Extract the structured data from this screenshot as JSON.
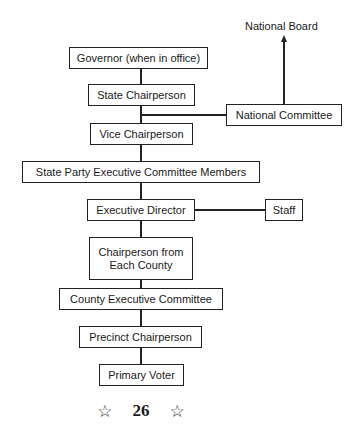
{
  "diagram": {
    "external": {
      "national_board": "National Board",
      "national_committee": "National Committee",
      "staff": "Staff"
    },
    "hierarchy": [
      {
        "id": "governor",
        "label": "Governor (when in office)"
      },
      {
        "id": "state-chairperson",
        "label": "State Chairperson"
      },
      {
        "id": "vice-chairperson",
        "label": "Vice Chairperson"
      },
      {
        "id": "state-party-exec-committee",
        "label": "State Party Executive Committee Members"
      },
      {
        "id": "executive-director",
        "label": "Executive Director"
      },
      {
        "id": "chairperson-each-county",
        "label_line1": "Chairperson from",
        "label_line2": "Each County"
      },
      {
        "id": "county-exec-committee",
        "label": "County Executive Committee"
      },
      {
        "id": "precinct-chairperson",
        "label": "Precinct Chairperson"
      },
      {
        "id": "primary-voter",
        "label": "Primary Voter"
      }
    ],
    "connections": [
      {
        "from": "Governor (when in office)",
        "to": "State Chairperson"
      },
      {
        "from": "State Chairperson",
        "to": "Vice Chairperson"
      },
      {
        "from": "State Chairperson",
        "to": "National Committee"
      },
      {
        "from": "National Committee",
        "to": "National Board",
        "arrow": true
      },
      {
        "from": "Vice Chairperson",
        "to": "State Party Executive Committee Members"
      },
      {
        "from": "State Party Executive Committee Members",
        "to": "Executive Director"
      },
      {
        "from": "Executive Director",
        "to": "Staff"
      },
      {
        "from": "Executive Director",
        "to": "Chairperson from Each County"
      },
      {
        "from": "Chairperson from Each County",
        "to": "County Executive Committee"
      },
      {
        "from": "County Executive Committee",
        "to": "Precinct Chairperson"
      },
      {
        "from": "Precinct Chairperson",
        "to": "Primary Voter"
      }
    ]
  },
  "footer": {
    "star_left": "☆",
    "page_number": "26",
    "star_right": "☆"
  }
}
